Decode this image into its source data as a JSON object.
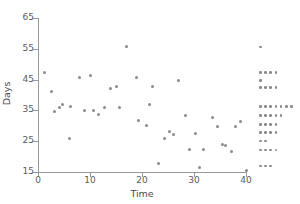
{
  "chart_data": {
    "type": "scatter",
    "title": "",
    "xlabel": "Time",
    "ylabel": "Days",
    "xlim": [
      0,
      42
    ],
    "ylim": [
      15,
      65
    ],
    "xticks": [
      0,
      10,
      20,
      30,
      40
    ],
    "yticks": [
      15,
      25,
      35,
      45,
      55,
      65
    ],
    "grid": false,
    "legend": null,
    "marker_color": "#8a8a8a",
    "axis_color": "#999999",
    "text_color": "#5a5a5a",
    "points": [
      {
        "x": 1.2,
        "y": 47.3
      },
      {
        "x": 2.5,
        "y": 41.0
      },
      {
        "x": 3.1,
        "y": 34.6
      },
      {
        "x": 4.2,
        "y": 35.8
      },
      {
        "x": 4.8,
        "y": 36.8
      },
      {
        "x": 6.0,
        "y": 26.0
      },
      {
        "x": 6.3,
        "y": 36.3
      },
      {
        "x": 8.0,
        "y": 45.6
      },
      {
        "x": 9.0,
        "y": 34.9
      },
      {
        "x": 10.0,
        "y": 46.3
      },
      {
        "x": 10.6,
        "y": 35.0
      },
      {
        "x": 11.6,
        "y": 33.8
      },
      {
        "x": 12.8,
        "y": 36.1
      },
      {
        "x": 14.0,
        "y": 42.2
      },
      {
        "x": 15.0,
        "y": 42.6
      },
      {
        "x": 15.6,
        "y": 36.1
      },
      {
        "x": 17.0,
        "y": 55.6
      },
      {
        "x": 19.0,
        "y": 45.6
      },
      {
        "x": 19.4,
        "y": 31.8
      },
      {
        "x": 20.8,
        "y": 30.2
      },
      {
        "x": 21.5,
        "y": 36.8
      },
      {
        "x": 22.0,
        "y": 42.6
      },
      {
        "x": 23.2,
        "y": 17.6
      },
      {
        "x": 24.3,
        "y": 26.0
      },
      {
        "x": 25.2,
        "y": 28.0
      },
      {
        "x": 26.1,
        "y": 27.1
      },
      {
        "x": 27.0,
        "y": 44.7
      },
      {
        "x": 28.4,
        "y": 33.3
      },
      {
        "x": 29.2,
        "y": 22.2
      },
      {
        "x": 30.2,
        "y": 27.5
      },
      {
        "x": 31.0,
        "y": 16.6
      },
      {
        "x": 31.8,
        "y": 22.2
      },
      {
        "x": 33.6,
        "y": 32.8
      },
      {
        "x": 34.5,
        "y": 29.8
      },
      {
        "x": 35.5,
        "y": 24.0
      },
      {
        "x": 36.0,
        "y": 23.6
      },
      {
        "x": 37.2,
        "y": 21.8
      },
      {
        "x": 38.0,
        "y": 29.8
      },
      {
        "x": 39.0,
        "y": 31.3
      },
      {
        "x": 40.0,
        "y": 15.6
      }
    ],
    "marginal": {
      "description": "stacked dot plot of Days distribution at right margin",
      "rows": [
        {
          "y": 55.6,
          "count": 1
        },
        {
          "y": 47.3,
          "count": 4
        },
        {
          "y": 44.7,
          "count": 1
        },
        {
          "y": 42.4,
          "count": 4
        },
        {
          "y": 36.2,
          "count": 7
        },
        {
          "y": 33.4,
          "count": 5
        },
        {
          "y": 30.4,
          "count": 4
        },
        {
          "y": 27.8,
          "count": 4
        },
        {
          "y": 25.0,
          "count": 2
        },
        {
          "y": 22.2,
          "count": 4
        },
        {
          "y": 17.0,
          "count": 3
        }
      ]
    }
  }
}
